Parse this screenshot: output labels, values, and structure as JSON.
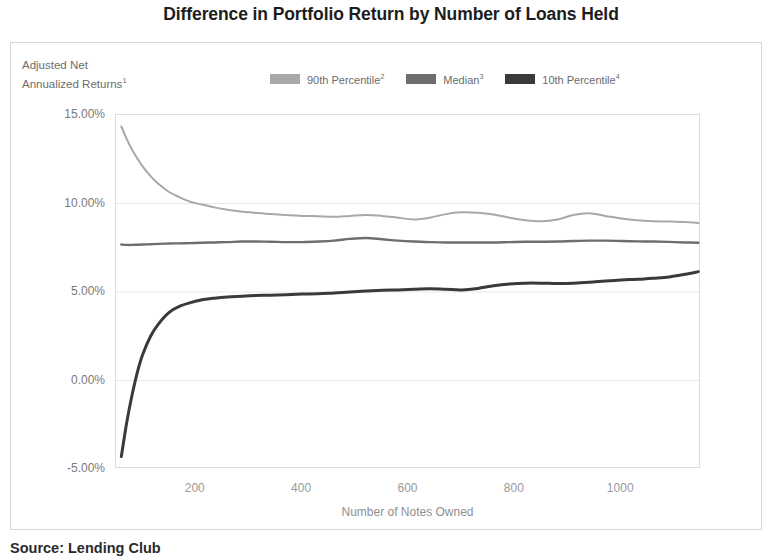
{
  "title": "Difference in Portfolio Return by Number of Loans Held",
  "y_axis_caption_line1": "Adjusted Net",
  "y_axis_caption_line2": "Annualized Returns",
  "y_axis_caption_sup": "1",
  "source_note": "Source: Lending Club",
  "colors": {
    "p90": "#a8a8a8",
    "median": "#6e6e6e",
    "p10": "#3a3a3a",
    "grid": "#e8e8e8",
    "frame": "#dcdcdc",
    "panel_border": "#d8d8d8",
    "title_text": "#1d1d1d",
    "axis_text": "#8f8f8f"
  },
  "legend": {
    "position": "top-center",
    "items": [
      {
        "label": "90th Percentile",
        "sup": "2",
        "swatch": "#a8a8a8",
        "name": "legend-p90"
      },
      {
        "label": "Median",
        "sup": "3",
        "swatch": "#6e6e6e",
        "name": "legend-median"
      },
      {
        "label": "10th Percentile",
        "sup": "4",
        "swatch": "#3a3a3a",
        "name": "legend-p10"
      }
    ]
  },
  "chart_data": {
    "type": "line",
    "title": "Difference in Portfolio Return by Number of Loans Held",
    "xlabel": "Number of Notes Owned",
    "ylabel": "Adjusted Net Annualized Returns",
    "xlim": [
      50,
      1150
    ],
    "ylim": [
      -5,
      15
    ],
    "grid": true,
    "legend_position": "top-center",
    "ytick_labels": [
      "15.00%",
      "10.00%",
      "5.00%",
      "0.00%",
      "-5.00%"
    ],
    "ytick_values": [
      15,
      10,
      5,
      0,
      -5
    ],
    "xtick_labels": [
      "200",
      "400",
      "600",
      "800",
      "1000"
    ],
    "xtick_values": [
      200,
      400,
      600,
      800,
      1000
    ],
    "x": [
      60,
      70,
      80,
      90,
      100,
      115,
      130,
      150,
      170,
      190,
      210,
      235,
      260,
      285,
      310,
      340,
      370,
      400,
      430,
      460,
      490,
      520,
      550,
      580,
      610,
      640,
      670,
      700,
      730,
      760,
      790,
      820,
      850,
      880,
      910,
      940,
      970,
      1000,
      1030,
      1060,
      1090,
      1120,
      1145
    ],
    "series": [
      {
        "name": "90th Percentile",
        "color": "#a8a8a8",
        "values": [
          14.35,
          13.65,
          13.05,
          12.55,
          12.1,
          11.55,
          11.1,
          10.65,
          10.35,
          10.1,
          9.95,
          9.78,
          9.65,
          9.55,
          9.48,
          9.4,
          9.35,
          9.3,
          9.28,
          9.25,
          9.3,
          9.35,
          9.3,
          9.2,
          9.1,
          9.2,
          9.4,
          9.5,
          9.48,
          9.38,
          9.2,
          9.05,
          9.0,
          9.1,
          9.35,
          9.45,
          9.3,
          9.15,
          9.05,
          9.0,
          8.98,
          8.95,
          8.9
        ]
      },
      {
        "name": "Median",
        "color": "#6e6e6e",
        "values": [
          7.68,
          7.66,
          7.66,
          7.67,
          7.68,
          7.7,
          7.72,
          7.74,
          7.75,
          7.76,
          7.78,
          7.8,
          7.82,
          7.85,
          7.85,
          7.84,
          7.82,
          7.82,
          7.85,
          7.9,
          8.0,
          8.05,
          7.98,
          7.9,
          7.85,
          7.82,
          7.8,
          7.8,
          7.8,
          7.8,
          7.82,
          7.84,
          7.84,
          7.85,
          7.88,
          7.9,
          7.9,
          7.88,
          7.86,
          7.85,
          7.83,
          7.8,
          7.78
        ]
      },
      {
        "name": "10th Percentile",
        "color": "#3a3a3a",
        "values": [
          -4.3,
          -2.4,
          -0.85,
          0.45,
          1.45,
          2.5,
          3.2,
          3.85,
          4.2,
          4.4,
          4.55,
          4.65,
          4.72,
          4.76,
          4.8,
          4.82,
          4.85,
          4.88,
          4.9,
          4.95,
          5.0,
          5.05,
          5.1,
          5.12,
          5.15,
          5.18,
          5.15,
          5.12,
          5.2,
          5.35,
          5.45,
          5.5,
          5.5,
          5.48,
          5.5,
          5.55,
          5.62,
          5.68,
          5.72,
          5.78,
          5.85,
          6.0,
          6.15
        ]
      }
    ]
  }
}
